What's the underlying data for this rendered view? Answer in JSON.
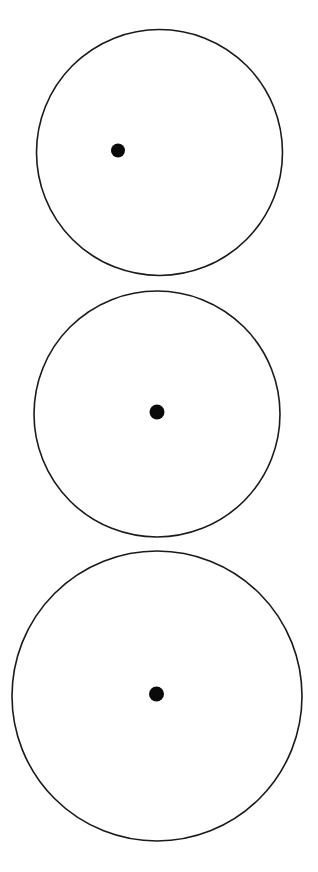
{
  "page": {
    "width": 318,
    "height": 872,
    "background": "#ffffff"
  },
  "colors": {
    "circle_stroke": "#1a1a1a",
    "dot_fill": "#0a0a0a"
  },
  "figures": [
    {
      "name": "top-circle-with-offset-dot",
      "circle": {
        "cx": 159.5,
        "cy": 152.5,
        "r": 123,
        "stroke_width": 1.6,
        "fill": "none"
      },
      "dot": {
        "cx": 118,
        "cy": 150.5,
        "r": 7
      }
    },
    {
      "name": "middle-circle-with-center-dot",
      "circle": {
        "cx": 157,
        "cy": 414,
        "r": 123,
        "stroke_width": 1.6,
        "fill": "none"
      },
      "dot": {
        "cx": 157,
        "cy": 412,
        "r": 7.5
      }
    },
    {
      "name": "bottom-circle-with-center-dot",
      "circle": {
        "cx": 157,
        "cy": 696,
        "r": 145,
        "stroke_width": 1.6,
        "fill": "none"
      },
      "dot": {
        "cx": 156.5,
        "cy": 694,
        "r": 7.5
      }
    }
  ]
}
